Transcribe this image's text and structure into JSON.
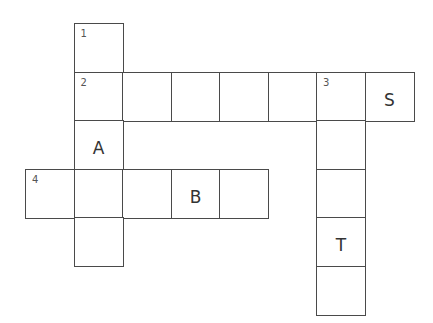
{
  "puzzle": {
    "type": "crossword",
    "cell_size": 48.5,
    "origin_x": 25,
    "origin_y": 23,
    "clue_numbers": [
      "1",
      "2",
      "3",
      "4"
    ],
    "cells": [
      {
        "col": 1,
        "row": 0,
        "number": "1",
        "letter": ""
      },
      {
        "col": 1,
        "row": 1,
        "number": "2",
        "letter": ""
      },
      {
        "col": 2,
        "row": 1,
        "number": "",
        "letter": ""
      },
      {
        "col": 3,
        "row": 1,
        "number": "",
        "letter": ""
      },
      {
        "col": 4,
        "row": 1,
        "number": "",
        "letter": ""
      },
      {
        "col": 5,
        "row": 1,
        "number": "",
        "letter": ""
      },
      {
        "col": 6,
        "row": 1,
        "number": "3",
        "letter": ""
      },
      {
        "col": 7,
        "row": 1,
        "number": "",
        "letter": "S"
      },
      {
        "col": 1,
        "row": 2,
        "number": "",
        "letter": "A"
      },
      {
        "col": 6,
        "row": 2,
        "number": "",
        "letter": ""
      },
      {
        "col": 0,
        "row": 3,
        "number": "4",
        "letter": ""
      },
      {
        "col": 1,
        "row": 3,
        "number": "",
        "letter": ""
      },
      {
        "col": 2,
        "row": 3,
        "number": "",
        "letter": ""
      },
      {
        "col": 3,
        "row": 3,
        "number": "",
        "letter": "B"
      },
      {
        "col": 4,
        "row": 3,
        "number": "",
        "letter": ""
      },
      {
        "col": 6,
        "row": 3,
        "number": "",
        "letter": ""
      },
      {
        "col": 1,
        "row": 4,
        "number": "",
        "letter": ""
      },
      {
        "col": 6,
        "row": 4,
        "number": "",
        "letter": "T"
      },
      {
        "col": 6,
        "row": 5,
        "number": "",
        "letter": ""
      }
    ],
    "colors": {
      "line": "#4a4a4a",
      "text": "#333333",
      "number": "#555555"
    }
  }
}
